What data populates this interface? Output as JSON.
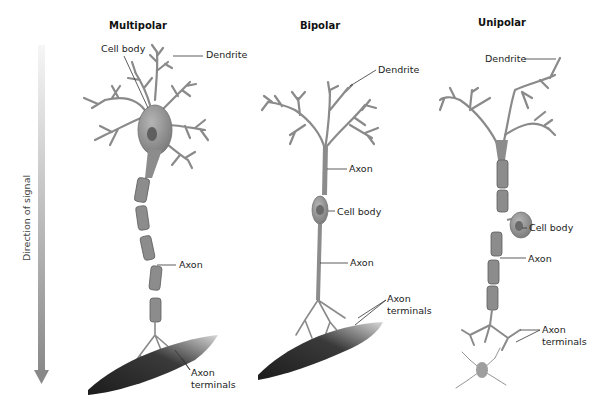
{
  "diagram": {
    "direction_label": "Direction of signal",
    "colors": {
      "neuron": "#8c8c8c",
      "neuron_dark": "#5e5e5e",
      "muscle": "#2e2e2e",
      "arrow_start": "#f4f4f4",
      "arrow_end": "#8a8a8a"
    },
    "neurons": [
      {
        "title": "Multipolar",
        "labels": {
          "cell_body": "Cell body",
          "dendrite": "Dendrite",
          "axon": "Axon",
          "axon_terminals_1": "Axon",
          "axon_terminals_2": "terminals"
        }
      },
      {
        "title": "Bipolar",
        "labels": {
          "dendrite": "Dendrite",
          "axon_upper": "Axon",
          "cell_body": "Cell body",
          "axon_lower": "Axon",
          "axon_terminals_1": "Axon",
          "axon_terminals_2": "terminals"
        }
      },
      {
        "title": "Unipolar",
        "labels": {
          "dendrite": "Dendrite",
          "cell_body": "Cell body",
          "axon": "Axon",
          "axon_terminals_1": "Axon",
          "axon_terminals_2": "terminals"
        }
      }
    ]
  }
}
